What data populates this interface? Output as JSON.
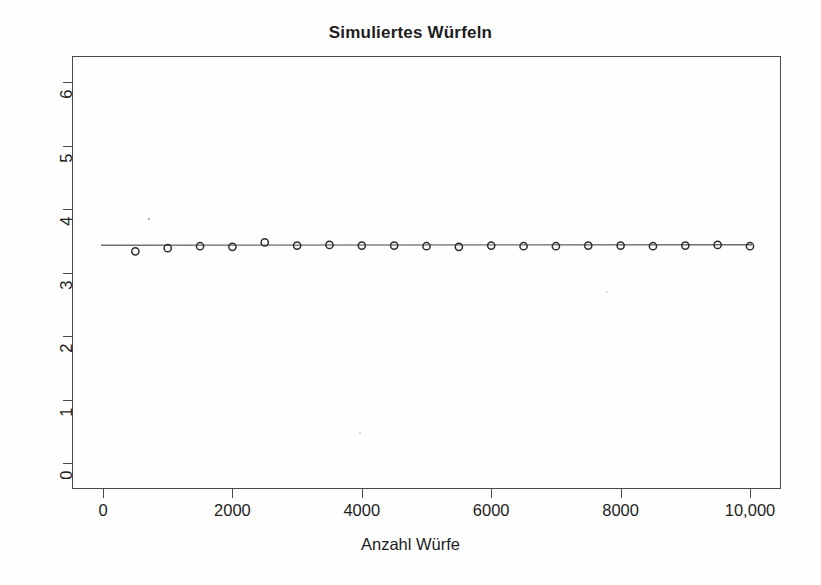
{
  "chart_data": {
    "type": "scatter",
    "title": "Simuliertes Würfeln",
    "xlabel": "Anzahl Würfe",
    "ylabel": "",
    "xlim": [
      0,
      10000
    ],
    "ylim": [
      0,
      6
    ],
    "grid": false,
    "legend": null,
    "x_tick_labels": [
      "0",
      "2000",
      "4000",
      "6000",
      "8000",
      "10,000"
    ],
    "x_tick_values": [
      0,
      2000,
      4000,
      6000,
      8000,
      10000
    ],
    "y_tick_labels": [
      "0",
      "1",
      "2",
      "3",
      "4",
      "5",
      "6"
    ],
    "y_tick_values": [
      0,
      1,
      2,
      3,
      4,
      5,
      6
    ],
    "marker": "open-circle",
    "reference_line": {
      "orientation": "horizontal",
      "y": 3.5,
      "label": "Erwartungswert 3.5"
    },
    "x": [
      500,
      1000,
      1500,
      2000,
      2500,
      3000,
      3500,
      4000,
      4500,
      5000,
      5500,
      6000,
      6500,
      7000,
      7500,
      8000,
      8500,
      9000,
      9500,
      10000
    ],
    "values": [
      3.4,
      3.45,
      3.48,
      3.47,
      3.54,
      3.49,
      3.5,
      3.49,
      3.49,
      3.48,
      3.47,
      3.49,
      3.48,
      3.48,
      3.49,
      3.49,
      3.48,
      3.49,
      3.5,
      3.48
    ],
    "series": [
      {
        "name": "Mittelwert der Würfe",
        "values": [
          3.4,
          3.45,
          3.48,
          3.47,
          3.54,
          3.49,
          3.5,
          3.49,
          3.49,
          3.48,
          3.47,
          3.49,
          3.48,
          3.48,
          3.49,
          3.49,
          3.48,
          3.49,
          3.5,
          3.48
        ]
      }
    ]
  },
  "colors": {
    "axis": "#4a4a4a",
    "marker": "#2b2b2b",
    "line": "#6b6b6b",
    "text": "#1d1d1d",
    "background": "#fefefe"
  }
}
